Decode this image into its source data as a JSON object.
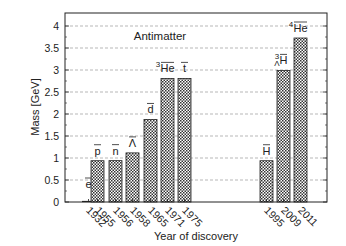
{
  "chart_data": {
    "type": "bar",
    "title": "Antimatter",
    "xlabel": "Year of discovery",
    "ylabel": "Mass [GeV]",
    "ylim": [
      0,
      4.3
    ],
    "yticks": [
      0,
      0.5,
      1,
      1.5,
      2,
      2.5,
      3,
      3.5,
      4
    ],
    "ytick_labels": [
      "0",
      "0.5",
      "1",
      "1.5",
      "2",
      "2.5",
      "3",
      "3.5",
      "4"
    ],
    "grid": "horizontal dashed",
    "legend": null,
    "bar_fill": "cross-hatch",
    "categories": [
      "1932",
      "1955",
      "1956",
      "1958",
      "1965",
      "1971",
      "1975",
      "1995",
      "2009",
      "2011"
    ],
    "particles": [
      "e̅",
      "p̅",
      "n̅",
      "Λ̅",
      "d̅",
      "³He̅",
      "t̅",
      "H̅",
      "³ΛH̅",
      "⁴He̅"
    ],
    "values": [
      0.000511,
      0.938,
      0.94,
      1.116,
      1.876,
      2.809,
      2.809,
      0.938,
      2.991,
      3.727
    ]
  },
  "bars": [
    {
      "year": "1932",
      "label_main": "e",
      "label_pre": "",
      "label_sup": "",
      "label_sub": "",
      "value": 0.000511,
      "x": 82
    },
    {
      "year": "1955",
      "label_main": "p",
      "label_pre": "",
      "label_sup": "",
      "label_sub": "",
      "value": 0.938,
      "x": 91
    },
    {
      "year": "1956",
      "label_main": "n",
      "label_pre": "",
      "label_sup": "",
      "label_sub": "",
      "value": 0.94,
      "x": 109
    },
    {
      "year": "1958",
      "label_main": "Λ",
      "label_pre": "",
      "label_sup": "",
      "label_sub": "",
      "value": 1.116,
      "x": 126
    },
    {
      "year": "1965",
      "label_main": "d",
      "label_pre": "",
      "label_sup": "",
      "label_sub": "",
      "value": 1.876,
      "x": 144
    },
    {
      "year": "1971",
      "label_main": "He",
      "label_pre": "",
      "label_sup": "3",
      "label_sub": "",
      "value": 2.809,
      "x": 161
    },
    {
      "year": "1975",
      "label_main": "t",
      "label_pre": "",
      "label_sup": "",
      "label_sub": "",
      "value": 2.809,
      "x": 178
    },
    {
      "year": "1995",
      "label_main": "H",
      "label_pre": "",
      "label_sup": "",
      "label_sub": "",
      "value": 0.938,
      "x": 260
    },
    {
      "year": "2009",
      "label_main": "H",
      "label_pre": "",
      "label_sup": "3",
      "label_sub": "Λ",
      "value": 2.991,
      "x": 277
    },
    {
      "year": "2011",
      "label_main": "He",
      "label_pre": "",
      "label_sup": "4",
      "label_sub": "",
      "value": 3.727,
      "x": 294
    }
  ],
  "colors": {
    "axis": "#222222",
    "grid": "#888888",
    "bar_stroke": "#222222",
    "background": "#ffffff"
  }
}
